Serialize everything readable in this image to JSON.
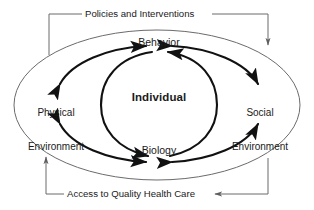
{
  "diagram": {
    "core": {
      "center_label": "Individual",
      "top_label": "Behavior",
      "bottom_label": "Biology"
    },
    "determinants": {
      "left_line1": "Physical",
      "left_line2": "Environment",
      "right_line1": "Social",
      "right_line2": "Environment"
    },
    "flows": {
      "top": "Policies and Interventions",
      "bottom": "Access to Quality Health Care"
    },
    "colors": {
      "ink": "#1a1a1a",
      "ellipse_stroke": "#6b6b6b",
      "connector_stroke": "#6b6b6b",
      "arrow_stroke": "#111111",
      "background": "#ffffff"
    }
  }
}
